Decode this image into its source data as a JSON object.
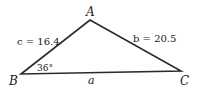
{
  "diagram": {
    "type": "triangle",
    "vertices": {
      "A": {
        "label": "A",
        "x": 90,
        "y": 20
      },
      "B": {
        "label": "B",
        "x": 21,
        "y": 74
      },
      "C": {
        "label": "C",
        "x": 181,
        "y": 71
      }
    },
    "sides": {
      "c": {
        "text": "c = 16.4"
      },
      "b": {
        "text": "b = 20.5"
      },
      "a": {
        "text": "a"
      }
    },
    "angle_B": {
      "text": "36°"
    },
    "line_color": "#2a2a2a"
  }
}
